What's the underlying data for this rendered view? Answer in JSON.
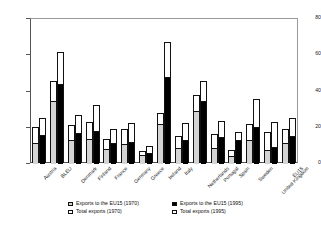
{
  "chart_data": {
    "type": "bar",
    "title": "",
    "subtitle": "",
    "xlabel": "",
    "ylabel": "",
    "ylim": [
      0,
      80
    ],
    "yticks": [
      0,
      20,
      40,
      60,
      80
    ],
    "grid": false,
    "legend_position": "bottom",
    "categories": [
      "Austria",
      "BLEU",
      "Denmark",
      "Finland",
      "France",
      "Germany",
      "Greece",
      "Ireland",
      "Italy",
      "Netherlands",
      "Portugal",
      "Spain",
      "Sweden",
      "United Kingdom",
      "EU15"
    ],
    "series": [
      {
        "name": "Exports to the EU15 (1970)",
        "color": "#d4d4d4",
        "values": [
          11.5,
          35.0,
          13.5,
          14.0,
          8.5,
          11.0,
          5.0,
          22.0,
          9.0,
          29.0,
          9.0,
          4.5,
          13.5,
          7.5,
          11.5
        ]
      },
      {
        "name": "Total exports (1970)",
        "color": "#ffffff",
        "values": [
          20.0,
          45.0,
          21.0,
          22.5,
          13.0,
          18.5,
          6.5,
          27.5,
          15.0,
          37.5,
          16.0,
          7.0,
          21.5,
          17.0,
          18.5
        ]
      },
      {
        "name": "Exports to the EU15 (1995)",
        "color": "#000000",
        "values": [
          16.0,
          44.0,
          17.0,
          18.0,
          11.5,
          12.0,
          6.0,
          48.0,
          13.0,
          35.0,
          15.0,
          13.5,
          20.5,
          9.5,
          15.5
        ]
      },
      {
        "name": "Total exports (1995)",
        "color": "#ffffff",
        "values": [
          25.0,
          61.0,
          26.5,
          32.0,
          19.0,
          22.0,
          9.5,
          67.0,
          22.0,
          45.0,
          23.0,
          17.0,
          35.5,
          22.5,
          25.0
        ]
      }
    ]
  },
  "legend": {
    "items": [
      {
        "label": "Exports to the EU15 (1970)",
        "swatch": "gray"
      },
      {
        "label": "Exports to the EU15 (1995)",
        "swatch": "black"
      },
      {
        "label": "Total exports (1970)",
        "swatch": "white"
      },
      {
        "label": "Total exports (1995)",
        "swatch": "white"
      }
    ]
  }
}
